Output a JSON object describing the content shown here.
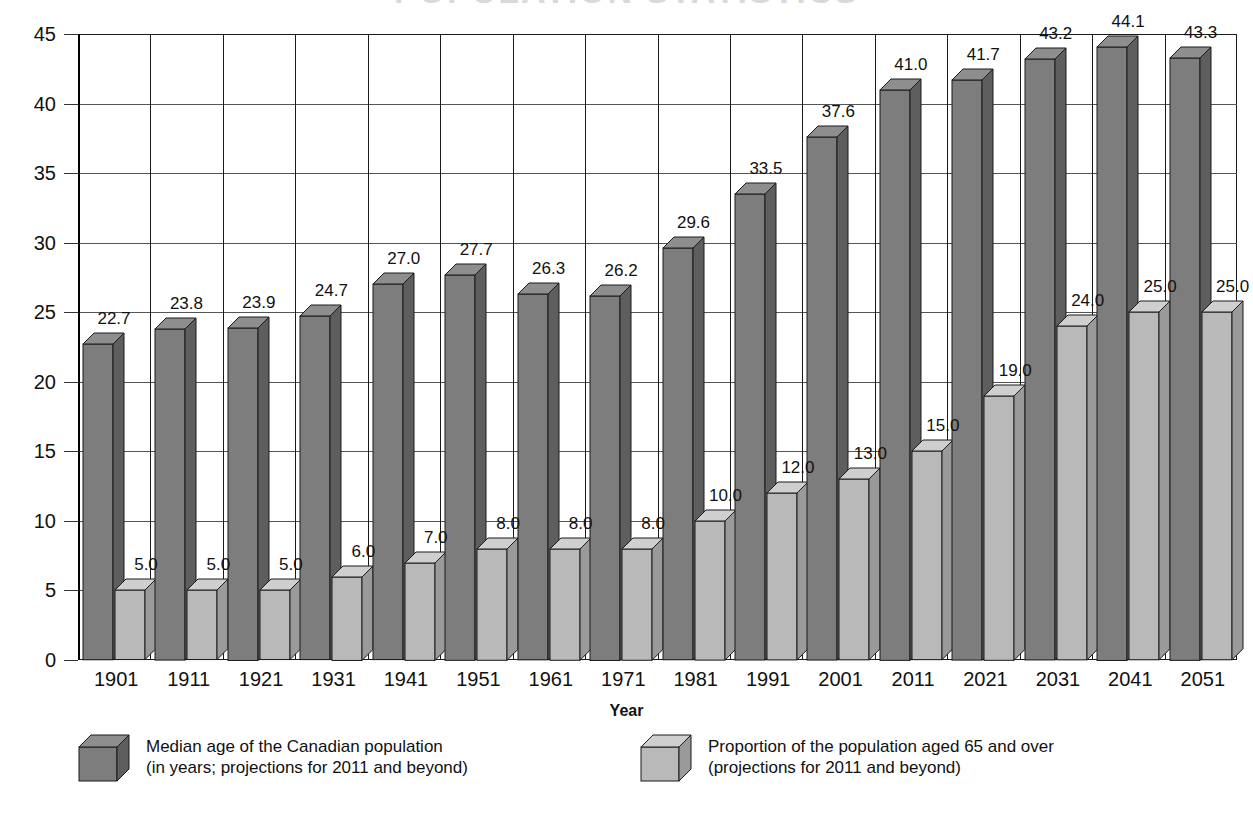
{
  "title_partial": "POPULATION  STATISTICS",
  "axis": {
    "x_title": "Year",
    "y_ticks": [
      0,
      5,
      10,
      15,
      20,
      25,
      30,
      35,
      40,
      45
    ]
  },
  "legend": {
    "items": [
      {
        "name": "median-age-series",
        "swatch": "dark",
        "label": "Median age of the Canadian population\n(in years; projections for 2011 and beyond)"
      },
      {
        "name": "proportion-65-plus-series",
        "swatch": "light",
        "label": "Proportion of the population aged 65 and over\n(projections for 2011 and beyond)"
      }
    ]
  },
  "colors": {
    "dark_front": "#7d7d7d",
    "dark_side": "#5e5e5e",
    "dark_top": "#8e8e8e",
    "light_front": "#b9b9b9",
    "light_side": "#9a9a9a",
    "light_top": "#cfcfcf",
    "grid": "#555555",
    "axis": "#1a1a1a"
  },
  "chart_data": {
    "type": "bar",
    "title": "",
    "xlabel": "Year",
    "ylabel": "",
    "ylim": [
      0,
      45
    ],
    "ytick_step": 5,
    "grid": true,
    "legend_position": "bottom",
    "categories": [
      "1901",
      "1911",
      "1921",
      "1931",
      "1941",
      "1951",
      "1961",
      "1971",
      "1981",
      "1991",
      "2001",
      "2011",
      "2021",
      "2031",
      "2041",
      "2051"
    ],
    "series": [
      {
        "name": "Median age of the Canadian population (in years; projections for 2011 and beyond)",
        "values": [
          22.7,
          23.8,
          23.9,
          24.7,
          27.0,
          27.7,
          26.3,
          26.2,
          29.6,
          33.5,
          37.6,
          41.0,
          41.7,
          43.2,
          44.1,
          43.3
        ],
        "labels": [
          "22.7",
          "23.8",
          "23.9",
          "24.7",
          "27.0",
          "27.7",
          "26.3",
          "26.2",
          "29.6",
          "33.5",
          "37.6",
          "41.0",
          "41.7",
          "43.2",
          "44.1",
          "43.3"
        ]
      },
      {
        "name": "Proportion of the population aged 65 and over (projections for 2011 and beyond)",
        "values": [
          5.0,
          5.0,
          5.0,
          6.0,
          7.0,
          8.0,
          8.0,
          8.0,
          10.0,
          12.0,
          13.0,
          15.0,
          19.0,
          24.0,
          25.0,
          25.0
        ],
        "labels": [
          "5.0",
          "5.0",
          "5.0",
          "6.0",
          "7.0",
          "8.0",
          "8.0",
          "8.0",
          "10.0",
          "12.0",
          "13.0",
          "15.0",
          "19.0",
          "24.0",
          "25.0",
          "25.0"
        ]
      }
    ]
  }
}
